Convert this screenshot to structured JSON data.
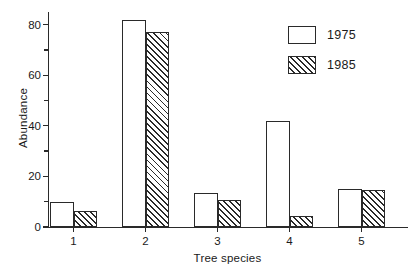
{
  "chart_data": {
    "type": "bar",
    "title": "",
    "subtitle": "",
    "xlabel": "Tree species",
    "ylabel": "Abundance",
    "categories": [
      "1",
      "2",
      "3",
      "4",
      "5"
    ],
    "series": [
      {
        "name": "1975",
        "values": [
          10,
          82,
          13.5,
          42,
          15
        ]
      },
      {
        "name": "1985",
        "values": [
          6.5,
          77,
          10.5,
          4.5,
          14.5
        ]
      }
    ],
    "ylim": [
      0,
      85
    ],
    "ytick_major": [
      0,
      20,
      40,
      60,
      80
    ],
    "ytick_minor": [
      10,
      30,
      50,
      70
    ],
    "ytick_labels": [
      "0",
      "20",
      "40",
      "60",
      "80"
    ],
    "xtick_labels": [
      "1",
      "2",
      "3",
      "4",
      "5"
    ],
    "grid": false,
    "legend_position": "top-right",
    "legend_entries": [
      "1975",
      "1985"
    ],
    "colors": {
      "axis": "#2a2a2a",
      "series_1975_fill": "#ffffff",
      "series_1985_hatch": "#2a2a2a",
      "background": "#ffffff"
    }
  },
  "legend": {
    "items": [
      {
        "label": "1975",
        "style": "solid-white"
      },
      {
        "label": "1985",
        "style": "diagonal-hatch"
      }
    ]
  }
}
